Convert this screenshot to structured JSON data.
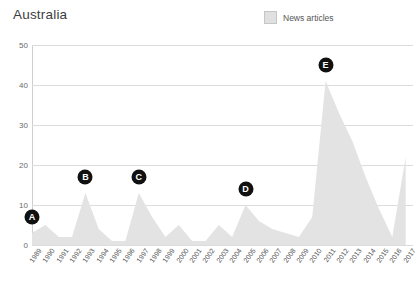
{
  "chart": {
    "title": "Australia",
    "legend": {
      "label": "News articles",
      "swatch_color": "#e0e0e0",
      "position": "top-right"
    }
  },
  "chart_data": {
    "type": "area",
    "title": "Australia",
    "xlabel": "",
    "ylabel": "",
    "ylim": [
      0,
      50
    ],
    "yticks": [
      0,
      10,
      20,
      30,
      40,
      50
    ],
    "grid": true,
    "x": [
      "1989",
      "1990",
      "1991",
      "1992",
      "1993",
      "1994",
      "1995",
      "1996",
      "1997",
      "1998",
      "1999",
      "2000",
      "2001",
      "2002",
      "2003",
      "2004",
      "2005",
      "2006",
      "2007",
      "2008",
      "2009",
      "2010",
      "2011",
      "2012",
      "2013",
      "2014",
      "2015",
      "2016",
      "2017"
    ],
    "series": [
      {
        "name": "News articles",
        "color": "#e3e3e3",
        "values": [
          3,
          5,
          2,
          2,
          13,
          4,
          1,
          1,
          13,
          7,
          2,
          5,
          1,
          1,
          5,
          2,
          10,
          6,
          4,
          3,
          2,
          7,
          41,
          33,
          26,
          17,
          9,
          2,
          22
        ]
      }
    ],
    "annotations": [
      {
        "label": "A",
        "x": "1989",
        "y": 3,
        "note": "marker-a"
      },
      {
        "label": "B",
        "x": "1993",
        "y": 13,
        "note": "marker-b"
      },
      {
        "label": "C",
        "x": "1997",
        "y": 13,
        "note": "marker-c"
      },
      {
        "label": "D",
        "x": "2005",
        "y": 10,
        "note": "marker-d"
      },
      {
        "label": "E",
        "x": "2011",
        "y": 41,
        "note": "marker-e"
      }
    ]
  },
  "markers": [
    {
      "label": "A"
    },
    {
      "label": "B"
    },
    {
      "label": "C"
    },
    {
      "label": "D"
    },
    {
      "label": "E"
    }
  ]
}
